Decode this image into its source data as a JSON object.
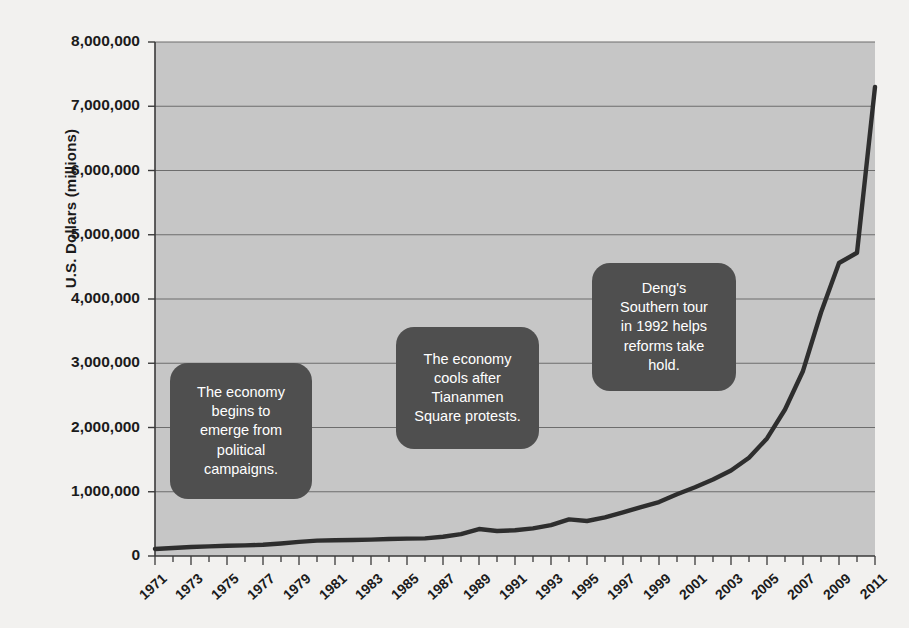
{
  "chart_data": {
    "type": "line",
    "title": "",
    "xlabel": "",
    "ylabel": "U.S. Dollars (millions)",
    "ylim": [
      0,
      8000000
    ],
    "xlim": [
      1971,
      2011
    ],
    "grid": true,
    "legend": null,
    "y_ticks": [
      "0",
      "1,000,000",
      "2,000,000",
      "3,000,000",
      "4,000,000",
      "5,000,000",
      "6,000,000",
      "7,000,000",
      "8,000,000"
    ],
    "y_tick_values": [
      0,
      1000000,
      2000000,
      3000000,
      4000000,
      5000000,
      6000000,
      7000000,
      8000000
    ],
    "x_ticks": [
      "1971",
      "1973",
      "1975",
      "1977",
      "1979",
      "1981",
      "1983",
      "1985",
      "1987",
      "1989",
      "1991",
      "1993",
      "1995",
      "1997",
      "1999",
      "2001",
      "2003",
      "2005",
      "2007",
      "2009",
      "2011"
    ],
    "x": [
      1971,
      1972,
      1973,
      1974,
      1975,
      1976,
      1977,
      1978,
      1979,
      1980,
      1981,
      1982,
      1983,
      1984,
      1985,
      1986,
      1987,
      1988,
      1989,
      1990,
      1991,
      1992,
      1993,
      1994,
      1995,
      1996,
      1997,
      1998,
      1999,
      2000,
      2001,
      2002,
      2003,
      2004,
      2005,
      2006,
      2007,
      2008,
      2009,
      2010,
      2011
    ],
    "values": [
      110000,
      125000,
      140000,
      150000,
      160000,
      165000,
      175000,
      195000,
      220000,
      240000,
      245000,
      250000,
      255000,
      265000,
      270000,
      275000,
      300000,
      340000,
      420000,
      390000,
      400000,
      430000,
      480000,
      570000,
      545000,
      600000,
      680000,
      760000,
      840000,
      960000,
      1070000,
      1190000,
      1330000,
      1530000,
      1830000,
      2280000,
      2880000,
      3790000,
      4560000,
      4720000,
      7300000
    ],
    "line_color": "#2e2e2e",
    "plot_background": "#c6c6c6",
    "page_background": "#f2f1ef"
  },
  "annotations": [
    {
      "id": "annotation-political-campaigns",
      "text": "The economy\nbegins to\nemerge from\npolitical\ncampaigns."
    },
    {
      "id": "annotation-tiananmen",
      "text": "The economy\ncools after\nTiananmen\nSquare protests."
    },
    {
      "id": "annotation-deng-southern-tour",
      "text": "Deng's\nSouthern tour\nin 1992 helps\nreforms take\nhold."
    }
  ]
}
